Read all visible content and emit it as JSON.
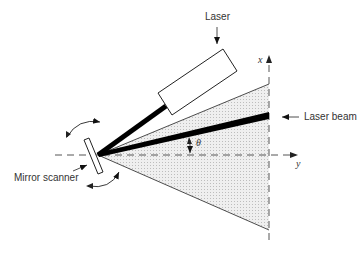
{
  "diagram": {
    "labels": {
      "laser": "Laser",
      "laser_beam": "Laser beam",
      "mirror_scanner": "Mirror scanner",
      "x_axis": "x",
      "y_axis": "y",
      "angle": "θ"
    },
    "colors": {
      "line": "#111111",
      "shading": "#d8d8d8",
      "text": "#333333"
    }
  }
}
